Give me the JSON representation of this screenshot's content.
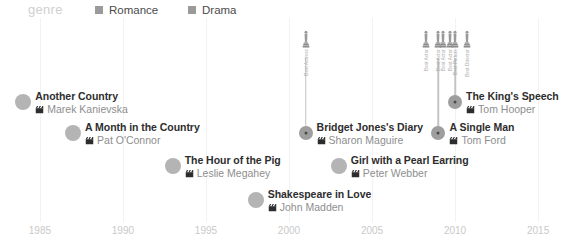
{
  "legend": {
    "title": "genre",
    "items": [
      {
        "label": "Romance",
        "color": "#9a9a9a"
      },
      {
        "label": "Drama",
        "color": "#9a9a9a"
      }
    ]
  },
  "axis": {
    "ticks": [
      "1985",
      "1990",
      "1995",
      "2000",
      "2005",
      "2010",
      "2015"
    ],
    "min": 1983.2,
    "max": 2016.5
  },
  "chart_data": {
    "type": "scatter",
    "title": "genre",
    "xlabel": "",
    "ylabel": "",
    "xlim": [
      1983.2,
      2016.5
    ],
    "grid": true,
    "legend_position": "top",
    "series": [
      {
        "name": "Films",
        "points": [
          {
            "title": "Another Country",
            "director": "Marek Kanievska",
            "year": 1984,
            "row": 0,
            "awards": []
          },
          {
            "title": "A Month in the Country",
            "director": "Pat O'Connor",
            "year": 1987,
            "row": 1,
            "awards": []
          },
          {
            "title": "The Hour of the Pig",
            "director": "Leslie Megahey",
            "year": 1993,
            "row": 2,
            "awards": []
          },
          {
            "title": "Shakespeare in Love",
            "director": "John Madden",
            "year": 1998,
            "row": 3,
            "awards": []
          },
          {
            "title": "Bridget Jones's Diary",
            "director": "Sharon Maguire",
            "year": 2001,
            "row": 1,
            "awards": [
              "Best Actress"
            ]
          },
          {
            "title": "Girl with a Pearl Earring",
            "director": "Peter Webber",
            "year": 2003,
            "row": 2,
            "awards": []
          },
          {
            "title": "A Single Man",
            "director": "Tom Ford",
            "year": 2009,
            "row": 1,
            "awards": [
              "Best Actor",
              "Best Actor",
              "Best Actor"
            ]
          },
          {
            "title": "The King's Speech",
            "director": "Tom Hooper",
            "year": 2010,
            "row": 0,
            "awards": [
              "Best Actor",
              "Best Picture",
              "Best Director"
            ]
          }
        ]
      }
    ]
  },
  "icons": {
    "clapper": "clapperboard-icon",
    "oscar": "oscar-statuette-icon"
  }
}
